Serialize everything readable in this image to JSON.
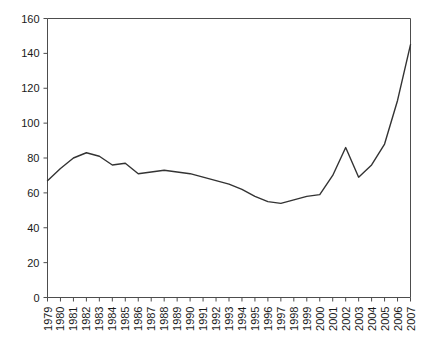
{
  "chart_data": {
    "type": "line",
    "title": "",
    "subtitle": "",
    "xlabel": "",
    "ylabel": "",
    "xlim": [
      1979,
      2007
    ],
    "ylim": [
      0,
      160
    ],
    "grid": false,
    "legend": null,
    "y_ticks": [
      0,
      20,
      40,
      60,
      80,
      100,
      120,
      140,
      160
    ],
    "categories": [
      "1979",
      "1980",
      "1981",
      "1982",
      "1983",
      "1984",
      "1985",
      "1986",
      "1987",
      "1988",
      "1989",
      "1990",
      "1991",
      "1992",
      "1993",
      "1994",
      "1995",
      "1996",
      "1997",
      "1998",
      "1999",
      "2000",
      "2001",
      "2002",
      "2003",
      "2004",
      "2005",
      "2006",
      "2007"
    ],
    "series": [
      {
        "name": "value",
        "color": "#333333",
        "values": [
          67,
          74,
          80,
          83,
          81,
          76,
          77,
          71,
          72,
          73,
          72,
          71,
          69,
          67,
          65,
          62,
          58,
          55,
          54,
          56,
          58,
          59,
          70,
          86,
          69,
          76,
          88,
          113,
          145
        ]
      }
    ]
  },
  "axes": {
    "line_color": "#4d4d4d",
    "tick_color": "#4d4d4d",
    "text_color": "#1a1a1a"
  }
}
